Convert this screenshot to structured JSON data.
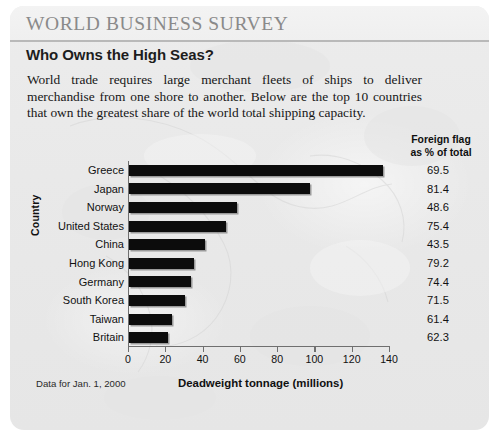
{
  "header": {
    "survey_title": "WORLD BUSINESS SURVEY",
    "headline": "Who Owns the High Seas?",
    "intro": "World trade requires large merchant fleets of ships to deliver merchandise from one shore to another. Below are the top 10 countries that own the greatest share of the world total shipping capacity."
  },
  "side_column": {
    "header_line1": "Foreign flag",
    "header_line2": "as % of total"
  },
  "footer": {
    "source_note": "Data for Jan. 1, 2000",
    "x_axis_title": "Deadweight tonnage (millions)"
  },
  "colors": {
    "bar": "#0c0c0c",
    "panel_background": "#e9e9e9",
    "title_text": "#8a8a8a",
    "axis": "#6f6f6f"
  },
  "chart_data": {
    "type": "bar",
    "orientation": "horizontal",
    "title": "Who Owns the High Seas?",
    "xlabel": "Deadweight tonnage (millions)",
    "ylabel": "Country",
    "xlim": [
      0,
      140
    ],
    "xticks": [
      0,
      20,
      40,
      60,
      80,
      100,
      120,
      140
    ],
    "grid": false,
    "legend": false,
    "categories": [
      "Greece",
      "Japan",
      "Norway",
      "United States",
      "China",
      "Hong Kong",
      "Germany",
      "South Korea",
      "Taiwan",
      "Britain"
    ],
    "values": [
      136,
      97,
      58,
      52,
      41,
      35,
      33,
      30,
      23,
      21
    ],
    "series": [
      {
        "name": "Deadweight tonnage (millions)",
        "values": [
          136,
          97,
          58,
          52,
          41,
          35,
          33,
          30,
          23,
          21
        ]
      }
    ],
    "annotation_column": {
      "label": "Foreign flag as % of total",
      "values": [
        69.5,
        81.4,
        48.6,
        75.4,
        43.5,
        79.2,
        74.4,
        71.5,
        61.4,
        62.3
      ]
    }
  }
}
